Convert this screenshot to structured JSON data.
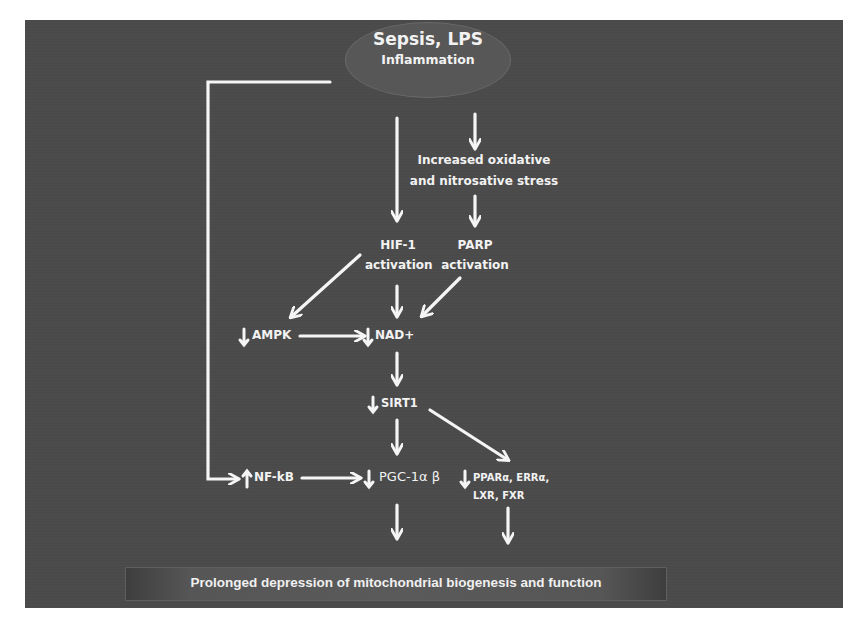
{
  "diagram": {
    "colors": {
      "background_panel": "#4a4a4a",
      "page_background": "#ffffff",
      "text": "#f2f2f2",
      "arrows": "#f5f5f5",
      "ellipse_fill": "#575757"
    },
    "nodes": {
      "source": {
        "line1": "Sepsis, LPS",
        "line2": "Inflammation"
      },
      "oxidative_stress": {
        "line1": "Increased oxidative",
        "line2": "and nitrosative  stress"
      },
      "hif1": {
        "line1": "HIF-1",
        "line2": "activation"
      },
      "parp": {
        "line1": "PARP",
        "line2": "activation"
      },
      "ampk": {
        "direction": "down",
        "label": "AMPK"
      },
      "nad": {
        "direction": "down",
        "label": "NAD+"
      },
      "sirt1": {
        "direction": "down",
        "label": "SIRT1"
      },
      "nfkb": {
        "direction": "up",
        "label": "NF-kB"
      },
      "pgc1": {
        "direction": "down",
        "label": "PGC-1α β"
      },
      "ppar": {
        "direction": "down",
        "line1": "PPARα, ERRα,",
        "line2": "LXR, FXR"
      },
      "outcome": {
        "label": "Prolonged depression of mitochondrial biogenesis and function"
      }
    },
    "edges": [
      {
        "from": "source",
        "to": "hif1"
      },
      {
        "from": "source",
        "to": "oxidative_stress"
      },
      {
        "from": "source",
        "to": "nfkb"
      },
      {
        "from": "oxidative_stress",
        "to": "parp"
      },
      {
        "from": "hif1",
        "to": "ampk"
      },
      {
        "from": "hif1",
        "to": "nad"
      },
      {
        "from": "parp",
        "to": "nad"
      },
      {
        "from": "ampk",
        "to": "nad"
      },
      {
        "from": "nad",
        "to": "sirt1"
      },
      {
        "from": "sirt1",
        "to": "pgc1"
      },
      {
        "from": "sirt1",
        "to": "ppar"
      },
      {
        "from": "nfkb",
        "to": "pgc1"
      },
      {
        "from": "pgc1",
        "to": "outcome"
      },
      {
        "from": "ppar",
        "to": "outcome"
      }
    ],
    "icons": {
      "down_arrow": "↓",
      "up_arrow": "↑"
    }
  }
}
